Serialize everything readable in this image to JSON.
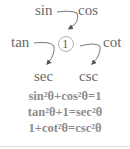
{
  "diagram": {
    "nodes": {
      "sin": "sin",
      "cos": "cos",
      "center": "1",
      "tan": "tan",
      "cot": "cot",
      "sec": "sec",
      "csc": "csc"
    },
    "edges": [
      {
        "from": "sin",
        "to": "center",
        "type": "curved-arrow",
        "via": "cos"
      },
      {
        "from": "tan",
        "to": "sec",
        "type": "curved-arrow"
      },
      {
        "from": "center",
        "to": "csc",
        "type": "curved-arrow",
        "via": "cot"
      }
    ],
    "identities": [
      "sin²θ+cos²θ=1",
      "tan²θ+1=sec²θ",
      "1+cot²θ=csc²θ"
    ]
  },
  "colors": {
    "text": "#6a6a6a",
    "identity_text": "#8c8c8c",
    "rule": "#dcdcdc"
  }
}
